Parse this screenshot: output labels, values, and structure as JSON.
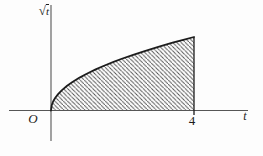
{
  "figure": {
    "background": "#fdfdfd",
    "curve_color": "#1c1c1c",
    "axis_color": "#565656",
    "hatch_color": "#4f4f4f"
  },
  "chart_data": {
    "type": "area",
    "title": "",
    "function": "y = √t",
    "xlabel": "t",
    "ylabel": "√t",
    "ylabel_parts": {
      "radical": "√",
      "variable": "t"
    },
    "origin_label": "O",
    "x_ticks": [
      {
        "value": 4,
        "label": "4"
      }
    ],
    "y_ticks": [],
    "xlim": [
      -1.2,
      5.5
    ],
    "ylim": [
      -0.9,
      2.9
    ],
    "grid": false,
    "legend": false,
    "curve": {
      "x": [
        0,
        0.02,
        0.06,
        0.12,
        0.2,
        0.3,
        0.45,
        0.6,
        0.8,
        1.0,
        1.25,
        1.5,
        1.75,
        2.0,
        2.3,
        2.6,
        3.0,
        3.4,
        3.7,
        4.0
      ],
      "y": [
        0,
        0.141,
        0.245,
        0.346,
        0.447,
        0.548,
        0.671,
        0.775,
        0.894,
        1.0,
        1.118,
        1.225,
        1.323,
        1.414,
        1.517,
        1.612,
        1.732,
        1.844,
        1.924,
        2.0
      ]
    },
    "shaded_region": {
      "type": "area-under-curve",
      "x_from": 0,
      "x_to": 4,
      "fill_style": "diagonal-hatch",
      "hatch_direction": "backslash"
    }
  }
}
